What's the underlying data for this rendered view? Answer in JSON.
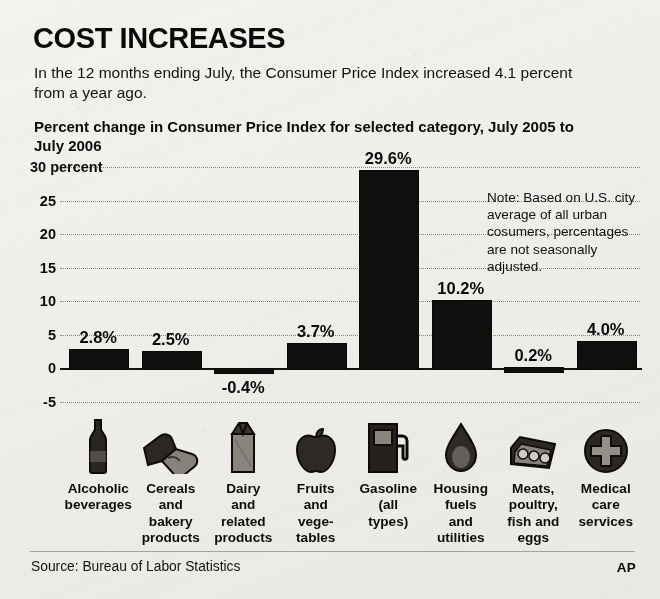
{
  "header": {
    "title": "COST INCREASES",
    "deck": "In the 12 months ending July, the Consumer Price Index increased 4.1 percent from a year ago.",
    "subtitle": "Percent change in Consumer Price Index for selected category, July 2005 to July 2006"
  },
  "note": "Note: Based on U.S. city average of all urban cosumers, percentages are not seasonally adjusted.",
  "footer": {
    "source": "Source: Bureau of Labor Statistics",
    "credit": "AP"
  },
  "axis": {
    "top_tick_label": "30 percent",
    "ticks": [
      "30 percent",
      "25",
      "20",
      "15",
      "10",
      "5",
      "0",
      "-5"
    ]
  },
  "icons": {
    "alcoholic_beverages": "bottle-icon",
    "cereals_bakery": "bread-icon",
    "dairy": "milk-carton-icon",
    "fruits_vegetables": "apple-icon",
    "gasoline": "gas-pump-icon",
    "housing_fuels": "droplet-icon",
    "meats_poultry": "egg-carton-icon",
    "medical_care": "medical-cross-icon"
  },
  "colors": {
    "bar": "#110f0d",
    "background": "#f3f2ef",
    "gridline": "#7a7873",
    "text": "#0d0c0a"
  },
  "chart_data": {
    "type": "bar",
    "title": "Percent change in Consumer Price Index for selected category, July 2005 to July 2006",
    "xlabel": "",
    "ylabel": "percent",
    "ylim": [
      -5,
      30
    ],
    "yticks": [
      -5,
      0,
      5,
      10,
      15,
      20,
      25,
      30
    ],
    "grid": true,
    "legend": false,
    "categories": [
      "Alcoholic beverages",
      "Cereals and bakery products",
      "Dairy and related products",
      "Fruits and vegetables",
      "Gasoline (all types)",
      "Housing fuels and utilities",
      "Meats, poultry, fish and eggs",
      "Medical care services"
    ],
    "category_lines": [
      [
        "Alcoholic",
        "beverages"
      ],
      [
        "Cereals",
        "and",
        "bakery",
        "products"
      ],
      [
        "Dairy",
        "and",
        "related",
        "products"
      ],
      [
        "Fruits",
        "and",
        "vege-",
        "tables"
      ],
      [
        "Gasoline",
        "(all",
        "types)"
      ],
      [
        "Housing",
        "fuels",
        "and",
        "utilities"
      ],
      [
        "Meats,",
        "poultry,",
        "fish and",
        "eggs"
      ],
      [
        "Medical",
        "care",
        "services"
      ]
    ],
    "values": [
      2.8,
      2.5,
      -0.4,
      3.7,
      29.6,
      10.2,
      0.2,
      4.0
    ],
    "value_labels": [
      "2.8%",
      "2.5%",
      "-0.4%",
      "3.7%",
      "29.6%",
      "10.2%",
      "0.2%",
      "4.0%"
    ],
    "annotation": "Note: Based on U.S. city average of all urban cosumers, percentages are not seasonally adjusted."
  }
}
